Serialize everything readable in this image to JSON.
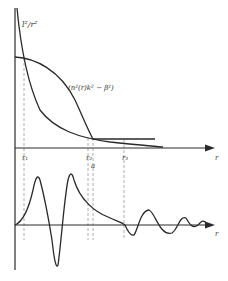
{
  "diagram": {
    "colors": {
      "ink": "#2a2a2a",
      "guide": "#9a9a9a",
      "background": "#ffffff"
    },
    "top_panel": {
      "axis_label": "r",
      "curves": [
        {
          "name": "centrifugal",
          "label": "l²/r²"
        },
        {
          "name": "potential",
          "label": "(n²(r)k² − β²)"
        }
      ],
      "markers": [
        {
          "label": "r₁"
        },
        {
          "label": "r₂"
        },
        {
          "label": "a"
        },
        {
          "label": "r₃"
        }
      ]
    },
    "bottom_panel": {
      "axis_label": "r"
    }
  }
}
